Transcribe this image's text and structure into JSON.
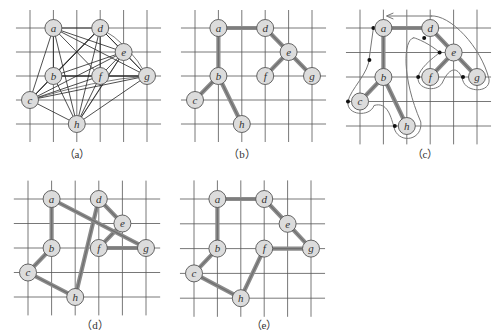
{
  "figure": {
    "colors": {
      "grid": "#555555",
      "node_fill": "#dcdcdc",
      "node_stroke": "#555555",
      "thin_edge": "#222222",
      "thick_edge": "#8c8c8c",
      "walk_path": "#777777",
      "dot": "#111111"
    },
    "grid": {
      "cols": 6,
      "rows": 5
    },
    "nodes": [
      {
        "id": "a",
        "label": "a",
        "col": 1,
        "row": 0
      },
      {
        "id": "d",
        "label": "d",
        "col": 3,
        "row": 0
      },
      {
        "id": "e",
        "label": "e",
        "col": 4,
        "row": 1
      },
      {
        "id": "b",
        "label": "b",
        "col": 1,
        "row": 2
      },
      {
        "id": "f",
        "label": "f",
        "col": 3,
        "row": 2
      },
      {
        "id": "g",
        "label": "g",
        "col": 5,
        "row": 2
      },
      {
        "id": "c",
        "label": "c",
        "col": 0,
        "row": 3
      },
      {
        "id": "h",
        "label": "h",
        "col": 2,
        "row": 4
      }
    ],
    "panels": [
      {
        "id": "a",
        "caption": "（a）",
        "x0": 30,
        "y0": 28,
        "dx": 23.4,
        "dy": 24,
        "caption_pos": [
          77,
          145
        ],
        "edge_style": "thin",
        "edges": "complete"
      },
      {
        "id": "b",
        "caption": "（b）",
        "x0": 195,
        "y0": 28,
        "dx": 23.4,
        "dy": 24,
        "caption_pos": [
          242,
          145
        ],
        "edge_style": "thick",
        "edges": [
          [
            "a",
            "d"
          ],
          [
            "a",
            "b"
          ],
          [
            "b",
            "c"
          ],
          [
            "b",
            "h"
          ],
          [
            "d",
            "e"
          ],
          [
            "e",
            "f"
          ],
          [
            "e",
            "g"
          ]
        ]
      },
      {
        "id": "c",
        "caption": "（c）",
        "x0": 360,
        "y0": 28,
        "dx": 23.4,
        "dy": 24.5,
        "caption_pos": [
          425,
          145
        ],
        "edge_style": "thick",
        "edges": [
          [
            "a",
            "d"
          ],
          [
            "a",
            "b"
          ],
          [
            "b",
            "c"
          ],
          [
            "b",
            "h"
          ],
          [
            "d",
            "e"
          ],
          [
            "e",
            "f"
          ],
          [
            "e",
            "g"
          ]
        ],
        "walk": true
      },
      {
        "id": "d",
        "caption": "（d）",
        "x0": 28,
        "y0": 199,
        "dx": 23.6,
        "dy": 24.5,
        "caption_pos": [
          95,
          316
        ],
        "edge_style": "thick",
        "edges": [
          [
            "a",
            "b"
          ],
          [
            "b",
            "c"
          ],
          [
            "c",
            "h"
          ],
          [
            "h",
            "d"
          ],
          [
            "d",
            "e"
          ],
          [
            "e",
            "f"
          ],
          [
            "f",
            "g"
          ],
          [
            "g",
            "a"
          ]
        ]
      },
      {
        "id": "e",
        "caption": "（e）",
        "x0": 194,
        "y0": 199,
        "dx": 23.4,
        "dy": 24.8,
        "caption_pos": [
          264,
          316
        ],
        "edge_style": "thick",
        "edges": [
          [
            "a",
            "d"
          ],
          [
            "d",
            "e"
          ],
          [
            "e",
            "g"
          ],
          [
            "g",
            "f"
          ],
          [
            "f",
            "h"
          ],
          [
            "h",
            "c"
          ],
          [
            "c",
            "b"
          ],
          [
            "b",
            "a"
          ]
        ]
      }
    ]
  }
}
